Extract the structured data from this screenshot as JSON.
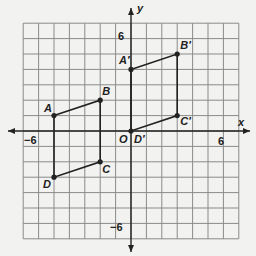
{
  "diagram": {
    "title": "",
    "axes": {
      "x_label": "x",
      "y_label": "y",
      "origin_label": "O",
      "tick_labels": {
        "x_neg": "−6",
        "x_pos": "6",
        "y_pos": "6",
        "y_neg": "−6"
      },
      "range": [
        -7,
        7
      ],
      "grid": true
    },
    "colors": {
      "grid": "#8a8a8a",
      "axis": "#222222",
      "shape": "#222222",
      "background": "#f2f2f0"
    },
    "figures": [
      {
        "name": "ABCD",
        "vertices": [
          {
            "label": "A",
            "x": -5,
            "y": 1
          },
          {
            "label": "B",
            "x": -2,
            "y": 2
          },
          {
            "label": "C",
            "x": -2,
            "y": -2
          },
          {
            "label": "D",
            "x": -5,
            "y": -3
          }
        ]
      },
      {
        "name": "A'B'C'D'",
        "vertices": [
          {
            "label": "A′",
            "x": 0,
            "y": 4
          },
          {
            "label": "B′",
            "x": 3,
            "y": 5
          },
          {
            "label": "C′",
            "x": 3,
            "y": 1
          },
          {
            "label": "D′",
            "x": 0,
            "y": 0
          }
        ]
      }
    ]
  }
}
